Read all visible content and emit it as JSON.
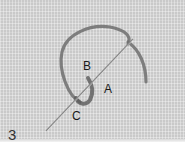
{
  "figure": {
    "step_number": "3",
    "labels": {
      "a": "A",
      "b": "B",
      "c": "C"
    },
    "colors": {
      "fabric": "#c9c9c9",
      "thread": "#6a6a6a",
      "needle": "#8a8a8a",
      "label": "#1a1a1a"
    }
  }
}
